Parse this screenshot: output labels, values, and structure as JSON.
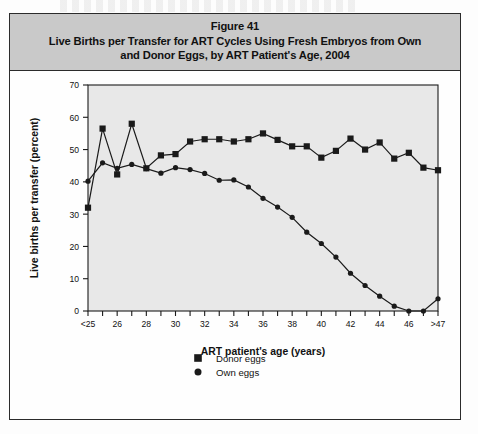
{
  "figure": {
    "title_lines": [
      "Figure 41",
      "Live Births per Transfer for ART Cycles Using Fresh Embryos from Own",
      "and Donor Eggs, by ART Patient's Age, 2004"
    ],
    "band_color": "#c9c9c9",
    "plot_bg": "#e8e8e8",
    "ink": "#1a1a1a"
  },
  "chart_data": {
    "type": "line",
    "title": "Live Births per Transfer for ART Cycles Using Fresh Embryos from Own and Donor Eggs, by ART Patient's Age, 2004",
    "xlabel": "ART patient's age (years)",
    "ylabel": "Live births per transfer (percent)",
    "ylim": [
      0,
      70
    ],
    "ytick_step": 10,
    "yticks": [
      0,
      10,
      20,
      30,
      40,
      50,
      60,
      70
    ],
    "grid": false,
    "legend_position": "bottom-center",
    "x": [
      "<25",
      "25",
      "26",
      "27",
      "28",
      "29",
      "30",
      "31",
      "32",
      "33",
      "34",
      "35",
      "36",
      "37",
      "38",
      "39",
      "40",
      "41",
      "42",
      "43",
      "44",
      "45",
      "46",
      "47",
      ">47"
    ],
    "xtick_labels": [
      "<25",
      "",
      "26",
      "",
      "28",
      "",
      "30",
      "",
      "32",
      "",
      "34",
      "",
      "36",
      "",
      "38",
      "",
      "40",
      "",
      "42",
      "",
      "44",
      "",
      "46",
      "",
      ">47"
    ],
    "series": [
      {
        "name": "Donor eggs",
        "marker": "square",
        "color": "#1a1a1a",
        "values": [
          32.0,
          56.5,
          42.3,
          58.0,
          44.2,
          48.2,
          48.6,
          52.5,
          53.2,
          53.2,
          52.5,
          53.2,
          55.0,
          53.0,
          51.0,
          51.0,
          47.5,
          49.6,
          53.4,
          50.0,
          52.2,
          47.2,
          49.0,
          44.4,
          43.6
        ]
      },
      {
        "name": "Own eggs",
        "marker": "circle",
        "color": "#1a1a1a",
        "values": [
          40.2,
          45.9,
          44.2,
          45.4,
          44.1,
          42.7,
          44.4,
          43.8,
          42.6,
          40.5,
          40.6,
          38.4,
          34.9,
          32.2,
          29.0,
          24.4,
          20.9,
          16.7,
          11.7,
          7.9,
          4.6,
          1.5,
          0.0,
          0.0,
          3.8
        ]
      }
    ],
    "legend": [
      "Donor eggs",
      "Own eggs"
    ]
  }
}
